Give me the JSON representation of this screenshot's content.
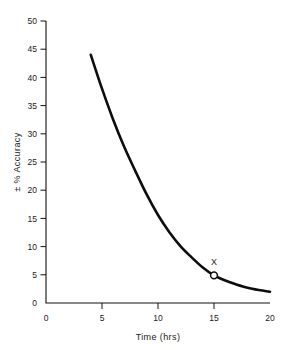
{
  "chart_data": {
    "type": "line",
    "title": "",
    "subtitle": "",
    "xlabel": "Time (hrs)",
    "ylabel": "± % Accuracy",
    "xlim": [
      0,
      20
    ],
    "ylim": [
      0,
      50
    ],
    "grid": false,
    "legend": null,
    "x_ticks": [
      0,
      5,
      10,
      15,
      20
    ],
    "x_tick_labels": [
      "0",
      "5",
      "10",
      "15",
      "20"
    ],
    "y_ticks": [
      0,
      5,
      10,
      15,
      20,
      25,
      30,
      35,
      40,
      45,
      50
    ],
    "y_tick_labels": [
      "0",
      "5",
      "10",
      "15",
      "20",
      "25",
      "30",
      "35",
      "40",
      "45",
      "50"
    ],
    "series": [
      {
        "name": "accuracy-decay",
        "color": "#0d0d0d",
        "x": [
          4,
          5,
          6,
          7,
          8,
          9,
          10,
          11,
          12,
          13,
          14,
          15,
          16,
          17,
          18,
          19,
          20
        ],
        "values": [
          44.0,
          38.0,
          32.5,
          27.6,
          23.3,
          19.2,
          15.6,
          12.6,
          10.1,
          8.1,
          6.3,
          4.9,
          4.0,
          3.3,
          2.7,
          2.3,
          2.0
        ]
      }
    ],
    "annotations": [
      {
        "name": "marked-point",
        "label": "X",
        "x": 15,
        "y": 4.9,
        "marker": "open-circle"
      }
    ]
  },
  "axis": {
    "y_title": "± % Accuracy",
    "x_title": "Time (hrs)"
  },
  "colors": {
    "curve": "#0d0d0d",
    "axis": "#111111",
    "background": "#ffffff",
    "marker_fill": "#ffffff"
  }
}
